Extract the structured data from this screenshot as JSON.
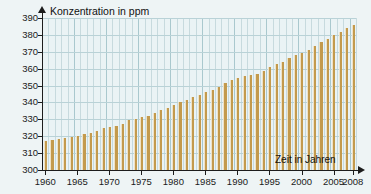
{
  "chart_data": {
    "type": "bar",
    "title": "",
    "ylabel": "Konzentration in ppm",
    "xlabel": "Zeit in Jahren",
    "ylim": [
      300,
      390
    ],
    "yticks": [
      300,
      310,
      320,
      330,
      340,
      350,
      360,
      370,
      380,
      390
    ],
    "xlim": [
      1960,
      2008
    ],
    "xticks": [
      1960,
      1965,
      1970,
      1975,
      1980,
      1985,
      1990,
      1995,
      2000,
      2005,
      2008
    ],
    "grid": true,
    "legend": "none",
    "bar_color": "#c39a4d",
    "bar_edge_color": "#efe2c6",
    "plot_bg": "#eaf3f5",
    "page_bg": "#eef4f5",
    "axis_color": "#1c1c1c",
    "categories": [
      1960,
      1961,
      1962,
      1963,
      1964,
      1965,
      1966,
      1967,
      1968,
      1969,
      1970,
      1971,
      1972,
      1973,
      1974,
      1975,
      1976,
      1977,
      1978,
      1979,
      1980,
      1981,
      1982,
      1983,
      1984,
      1985,
      1986,
      1987,
      1988,
      1989,
      1990,
      1991,
      1992,
      1993,
      1994,
      1995,
      1996,
      1997,
      1998,
      1999,
      2000,
      2001,
      2002,
      2003,
      2004,
      2005,
      2006,
      2007,
      2008
    ],
    "values": [
      316.9,
      317.6,
      318.4,
      318.9,
      319.5,
      320.0,
      321.4,
      322.2,
      323.0,
      324.6,
      325.7,
      326.3,
      327.5,
      329.7,
      330.2,
      331.1,
      332.0,
      333.8,
      335.4,
      336.8,
      338.7,
      340.1,
      341.4,
      343.0,
      344.6,
      346.0,
      347.4,
      349.2,
      351.6,
      353.1,
      354.4,
      355.6,
      356.4,
      357.1,
      358.8,
      360.8,
      362.6,
      363.8,
      366.6,
      368.3,
      369.5,
      371.0,
      373.2,
      375.8,
      377.5,
      379.8,
      381.9,
      383.8,
      385.6
    ]
  },
  "axis": {
    "y_title": "Konzentration in ppm",
    "x_title": "Zeit in Jahren"
  }
}
